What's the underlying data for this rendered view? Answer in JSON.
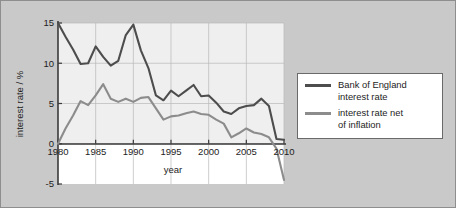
{
  "chart_data": {
    "type": "line",
    "title": "",
    "xlabel": "year",
    "ylabel": "interest rate / %",
    "xlim": [
      1980,
      2010
    ],
    "ylim": [
      -5,
      15
    ],
    "xticks": [
      1980,
      1985,
      1990,
      1995,
      2000,
      2005,
      2010
    ],
    "yticks": [
      -5,
      0,
      5,
      10,
      15
    ],
    "grid": true,
    "legend_position": "right-outside",
    "x": [
      1980,
      1981,
      1982,
      1983,
      1984,
      1985,
      1986,
      1987,
      1988,
      1989,
      1990,
      1991,
      1992,
      1993,
      1994,
      1995,
      1996,
      1997,
      1998,
      1999,
      2000,
      2001,
      2002,
      2003,
      2004,
      2005,
      2006,
      2007,
      2008,
      2009,
      2010
    ],
    "series": [
      {
        "name": "Bank of England interest rate",
        "color": "#4d4d4d",
        "values": [
          15.0,
          13.3,
          11.7,
          9.9,
          10.0,
          12.1,
          10.8,
          9.7,
          10.3,
          13.5,
          14.8,
          11.6,
          9.4,
          6.0,
          5.4,
          6.6,
          5.9,
          6.6,
          7.3,
          5.9,
          6.0,
          5.1,
          4.0,
          3.7,
          4.4,
          4.7,
          4.8,
          5.6,
          4.7,
          0.6,
          0.5
        ]
      },
      {
        "name": "interest rate net of inflation",
        "color": "#8c8c8c",
        "values": [
          0.0,
          1.9,
          3.5,
          5.3,
          4.8,
          6.0,
          7.4,
          5.6,
          5.2,
          5.6,
          5.2,
          5.7,
          5.8,
          4.4,
          3.0,
          3.4,
          3.5,
          3.8,
          4.0,
          3.7,
          3.6,
          3.0,
          2.5,
          0.8,
          1.3,
          1.9,
          1.4,
          1.2,
          0.8,
          -0.6,
          -4.5
        ]
      }
    ]
  },
  "legend": {
    "entries": [
      {
        "label": "Bank of England\ninterest rate",
        "swatch": "boe"
      },
      {
        "label": "interest rate net\nof inflation",
        "swatch": "net"
      }
    ]
  },
  "axes": {
    "y_title": "interest rate / %",
    "x_title": "year",
    "y_tick_labels": [
      "15",
      "10",
      "5",
      "0",
      "-5"
    ],
    "x_tick_labels": [
      "1980",
      "1985",
      "1990",
      "1995",
      "2000",
      "2005",
      "2010"
    ]
  },
  "colors": {
    "background": "#c9c9c9",
    "plot_upper": "#efefef",
    "plot_lower": "#ffffff",
    "series_boe": "#4d4d4d",
    "series_net": "#8c8c8c",
    "axis": "#3a3a3a",
    "grid": "#b9b9b9"
  }
}
